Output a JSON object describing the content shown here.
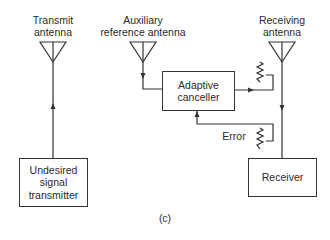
{
  "diagram": {
    "caption": "(c)",
    "antennas": {
      "transmit": {
        "label_line1": "Transmit",
        "label_line2": "antenna"
      },
      "auxiliary": {
        "label_line1": "Auxiliary",
        "label_line2": "reference antenna"
      },
      "receiving": {
        "label_line1": "Receiving",
        "label_line2": "antenna"
      }
    },
    "blocks": {
      "undesired_transmitter": {
        "line1": "Undesired",
        "line2": "signal",
        "line3": "transmitter"
      },
      "adaptive_canceller": {
        "line1": "Adaptive",
        "line2": "canceller"
      },
      "receiver": {
        "line1": "Receiver"
      }
    },
    "signals": {
      "error_label": "Error"
    },
    "colors": {
      "line": "#333333",
      "text": "#2a2a2a",
      "background": "#ffffff"
    }
  }
}
